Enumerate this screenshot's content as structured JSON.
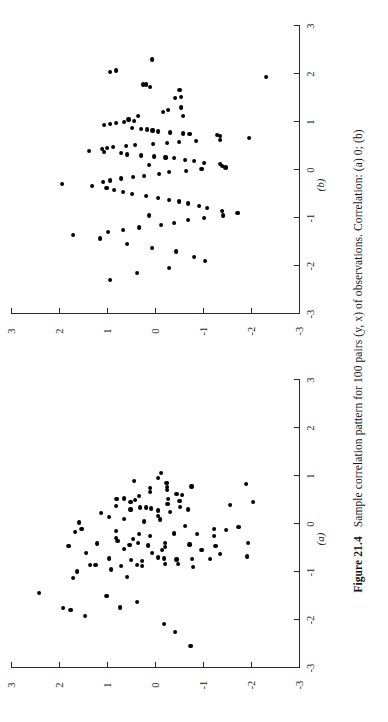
{
  "figure": {
    "number": "Figure 21.4",
    "caption_text": "Sample correlation pattern for 100 pairs (y, x) of observations. Correlation: (a) 0; (b)",
    "caption_full": "Figure 21.4   Sample correlation pattern for 100 pairs (y, x) of observations. Correlation: (a) 0; (b)",
    "rotation_degrees": "-90"
  },
  "axis": {
    "tick_values": [
      -3,
      -2,
      -1,
      0,
      1,
      2,
      3
    ],
    "tick_labels": [
      "-3",
      "-2",
      "-1",
      "0",
      "1",
      "2",
      "3"
    ],
    "xlim": [
      -3,
      3
    ],
    "ylim": [
      -3,
      3
    ]
  },
  "chart_data": [
    {
      "type": "scatter",
      "id": "a",
      "panel_label": "(a)",
      "title": "",
      "xlabel": "",
      "ylabel": "",
      "xlim": [
        -3,
        3
      ],
      "ylim": [
        -3,
        3
      ],
      "xticks": [
        -3,
        -2,
        -1,
        0,
        1,
        2,
        3
      ],
      "yticks": [
        -3,
        -2,
        -1,
        0,
        1,
        2,
        3
      ],
      "grid": false,
      "legend": null,
      "correlation": 0,
      "n_points": 100,
      "points": [
        [
          -1.44,
          2.43
        ],
        [
          -1.75,
          1.93
        ],
        [
          -1.8,
          1.78
        ],
        [
          -1.12,
          1.73
        ],
        [
          -0.99,
          1.64
        ],
        [
          -0.46,
          1.82
        ],
        [
          -1.92,
          1.48
        ],
        [
          -0.17,
          1.68
        ],
        [
          -0.11,
          1.55
        ],
        [
          0.03,
          1.6
        ],
        [
          -0.6,
          1.46
        ],
        [
          -0.85,
          1.38
        ],
        [
          -0.86,
          1.26
        ],
        [
          -0.41,
          1.23
        ],
        [
          0.22,
          1.14
        ],
        [
          -1.5,
          1.03
        ],
        [
          -0.95,
          0.94
        ],
        [
          -0.72,
          0.97
        ],
        [
          -0.29,
          0.84
        ],
        [
          -0.15,
          0.84
        ],
        [
          -0.35,
          0.8
        ],
        [
          0.37,
          0.84
        ],
        [
          0.52,
          0.82
        ],
        [
          -1.74,
          0.75
        ],
        [
          -0.87,
          0.72
        ],
        [
          -0.53,
          0.67
        ],
        [
          0.53,
          0.66
        ],
        [
          -0.75,
          0.52
        ],
        [
          -0.44,
          0.55
        ],
        [
          -0.31,
          0.48
        ],
        [
          0.3,
          0.53
        ],
        [
          0.45,
          0.53
        ],
        [
          -1.63,
          0.4
        ],
        [
          -0.86,
          0.4
        ],
        [
          -0.87,
          0.29
        ],
        [
          -0.78,
          0.29
        ],
        [
          -0.39,
          0.38
        ],
        [
          -0.21,
          0.35
        ],
        [
          0.34,
          0.33
        ],
        [
          0.34,
          0.21
        ],
        [
          0.58,
          0.36
        ],
        [
          -0.45,
          0.16
        ],
        [
          -0.25,
          0.12
        ],
        [
          0.32,
          0.11
        ],
        [
          0.66,
          0.12
        ],
        [
          0.75,
          0.12
        ],
        [
          -0.7,
          -0.05
        ],
        [
          -0.55,
          -0.12
        ],
        [
          0.09,
          -0.08
        ],
        [
          0.17,
          -0.04
        ],
        [
          0.28,
          -0.04
        ],
        [
          0.96,
          -0.04
        ],
        [
          1.06,
          -0.11
        ],
        [
          -2.08,
          -0.17
        ],
        [
          -0.84,
          -0.19
        ],
        [
          -0.72,
          -0.16
        ],
        [
          -0.48,
          -0.19
        ],
        [
          -0.39,
          -0.19
        ],
        [
          0.24,
          -0.3
        ],
        [
          0.42,
          -0.24
        ],
        [
          0.52,
          -0.26
        ],
        [
          0.7,
          -0.23
        ],
        [
          0.77,
          -0.23
        ],
        [
          0.86,
          -0.22
        ],
        [
          -2.26,
          -0.4
        ],
        [
          -0.83,
          -0.46
        ],
        [
          -0.74,
          -0.43
        ],
        [
          -0.2,
          -0.37
        ],
        [
          0.35,
          -0.5
        ],
        [
          0.48,
          -0.49
        ],
        [
          0.6,
          -0.54
        ],
        [
          -2.55,
          -0.72
        ],
        [
          -0.9,
          -0.77
        ],
        [
          -0.73,
          -0.76
        ],
        [
          -0.43,
          -0.7
        ],
        [
          0.3,
          -0.66
        ],
        [
          0.78,
          -0.74
        ],
        [
          -0.54,
          -0.95
        ],
        [
          -0.73,
          -1.13
        ],
        [
          -0.46,
          -1.24
        ],
        [
          -0.25,
          -1.21
        ],
        [
          -0.11,
          -1.21
        ],
        [
          -0.62,
          -1.33
        ],
        [
          -0.13,
          -1.46
        ],
        [
          0.4,
          -1.55
        ],
        [
          -0.07,
          -1.72
        ],
        [
          -0.68,
          -1.9
        ],
        [
          -0.4,
          -1.92
        ],
        [
          0.83,
          -1.88
        ],
        [
          0.46,
          -2.02
        ],
        [
          -1.11,
          0.6
        ],
        [
          0.1,
          0.66
        ],
        [
          -0.05,
          -0.6
        ],
        [
          0.62,
          -0.43
        ],
        [
          0.15,
          0.98
        ],
        [
          -0.21,
          -0.85
        ],
        [
          0.5,
          0.44
        ],
        [
          0.05,
          0.25
        ],
        [
          -0.61,
          0.09
        ],
        [
          0.9,
          0.45
        ]
      ]
    },
    {
      "type": "scatter",
      "id": "b",
      "panel_label": "(b)",
      "title": "",
      "xlabel": "",
      "ylabel": "",
      "xlim": [
        -3,
        3
      ],
      "ylim": [
        -3,
        3
      ],
      "xticks": [
        -3,
        -2,
        -1,
        0,
        1,
        2,
        3
      ],
      "yticks": [
        -3,
        -2,
        -1,
        0,
        1,
        2,
        3
      ],
      "grid": false,
      "legend": null,
      "correlation": null,
      "n_points": 100,
      "points": [
        [
          1.93,
          -2.29
        ],
        [
          1.67,
          -0.49
        ],
        [
          1.5,
          -0.4
        ],
        [
          1.72,
          0.13
        ],
        [
          2.3,
          0.08
        ],
        [
          2.07,
          0.83
        ],
        [
          2.04,
          0.95
        ],
        [
          1.78,
          0.21
        ],
        [
          1.78,
          0.27
        ],
        [
          1.52,
          -0.52
        ],
        [
          1.3,
          -0.52
        ],
        [
          1.12,
          -0.56
        ],
        [
          1.25,
          -0.26
        ],
        [
          1.2,
          -0.15
        ],
        [
          1.13,
          0.37
        ],
        [
          1.02,
          0.46
        ],
        [
          1.05,
          0.57
        ],
        [
          1.0,
          0.67
        ],
        [
          0.98,
          0.83
        ],
        [
          0.95,
          0.96
        ],
        [
          0.93,
          1.08
        ],
        [
          0.88,
          0.5
        ],
        [
          0.86,
          0.31
        ],
        [
          0.84,
          0.19
        ],
        [
          0.82,
          0.07
        ],
        [
          0.8,
          -0.04
        ],
        [
          0.78,
          -0.3
        ],
        [
          0.76,
          -0.56
        ],
        [
          0.74,
          -0.7
        ],
        [
          0.72,
          -1.28
        ],
        [
          0.7,
          -1.34
        ],
        [
          0.66,
          -1.94
        ],
        [
          0.62,
          -1.34
        ],
        [
          0.6,
          -0.83
        ],
        [
          0.58,
          -0.48
        ],
        [
          0.56,
          -0.23
        ],
        [
          0.54,
          0.06
        ],
        [
          0.52,
          0.44
        ],
        [
          0.5,
          0.62
        ],
        [
          0.48,
          0.9
        ],
        [
          0.46,
          1.02
        ],
        [
          0.44,
          1.12
        ],
        [
          0.4,
          1.4
        ],
        [
          0.38,
          1.08
        ],
        [
          0.35,
          0.72
        ],
        [
          0.32,
          0.6
        ],
        [
          0.3,
          0.31
        ],
        [
          0.28,
          0.04
        ],
        [
          0.26,
          -0.2
        ],
        [
          0.24,
          -0.37
        ],
        [
          0.2,
          -0.6
        ],
        [
          0.18,
          -0.79
        ],
        [
          0.15,
          -1.0
        ],
        [
          0.12,
          -1.34
        ],
        [
          0.08,
          -1.38
        ],
        [
          0.05,
          -1.45
        ],
        [
          0.02,
          -0.95
        ],
        [
          -0.02,
          -0.62
        ],
        [
          -0.05,
          -0.28
        ],
        [
          -0.08,
          -0.07
        ],
        [
          -0.12,
          0.24
        ],
        [
          -0.15,
          0.48
        ],
        [
          -0.18,
          0.72
        ],
        [
          -0.22,
          0.95
        ],
        [
          -0.26,
          1.1
        ],
        [
          -0.3,
          1.95
        ],
        [
          -0.34,
          1.33
        ],
        [
          -0.38,
          1.03
        ],
        [
          -0.42,
          0.88
        ],
        [
          -0.46,
          0.68
        ],
        [
          -0.5,
          0.5
        ],
        [
          -0.54,
          0.2
        ],
        [
          -0.58,
          -0.05
        ],
        [
          -0.62,
          -0.27
        ],
        [
          -0.66,
          -0.48
        ],
        [
          -0.7,
          -0.66
        ],
        [
          -0.75,
          -0.9
        ],
        [
          -0.8,
          -1.07
        ],
        [
          -0.85,
          -1.38
        ],
        [
          -0.9,
          -1.7
        ],
        [
          -0.95,
          -1.4
        ],
        [
          -1.0,
          -1.0
        ],
        [
          -1.05,
          -0.66
        ],
        [
          -1.1,
          -0.38
        ],
        [
          -1.15,
          -0.11
        ],
        [
          -1.2,
          0.35
        ],
        [
          -1.25,
          0.68
        ],
        [
          -1.3,
          1.0
        ],
        [
          -1.36,
          1.73
        ],
        [
          -1.43,
          1.17
        ],
        [
          -1.55,
          0.6
        ],
        [
          -1.62,
          0.08
        ],
        [
          -1.7,
          -0.42
        ],
        [
          -1.82,
          -0.8
        ],
        [
          -1.9,
          -1.02
        ],
        [
          -2.05,
          -0.28
        ],
        [
          -2.15,
          0.4
        ],
        [
          -2.3,
          0.95
        ],
        [
          0.1,
          0.15
        ],
        [
          -0.95,
          0.15
        ]
      ]
    }
  ]
}
